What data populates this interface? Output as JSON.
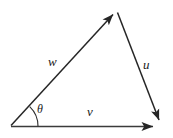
{
  "figure": {
    "name": "vector-triangle-diagram",
    "background_color": "#ffffff",
    "stroke_color": "#262626",
    "baseline_color": "#3b3b3b",
    "width": 173,
    "height": 138
  },
  "labels": {
    "w": "w",
    "u": "u",
    "v": "v",
    "theta": "θ"
  },
  "vectors": [
    {
      "id": "w",
      "label": "w",
      "from": [
        11,
        126
      ],
      "to": [
        116,
        12
      ],
      "arrowhead": "at-end",
      "label_pos": [
        50,
        56
      ]
    },
    {
      "id": "u",
      "label": "u",
      "from": [
        117,
        12
      ],
      "to": [
        161,
        126
      ],
      "arrowhead": "at-end",
      "label_pos": [
        145,
        59
      ]
    },
    {
      "id": "v",
      "label": "v",
      "from": [
        11,
        127
      ],
      "to": [
        161,
        127
      ],
      "arrowhead": "at-end",
      "label_pos": [
        88,
        106
      ]
    }
  ],
  "angle_arc": {
    "id": "theta",
    "label": "θ",
    "vertex": [
      11,
      126
    ],
    "radius": 27,
    "between": [
      "v",
      "w"
    ],
    "label_pos": [
      38,
      104
    ]
  }
}
